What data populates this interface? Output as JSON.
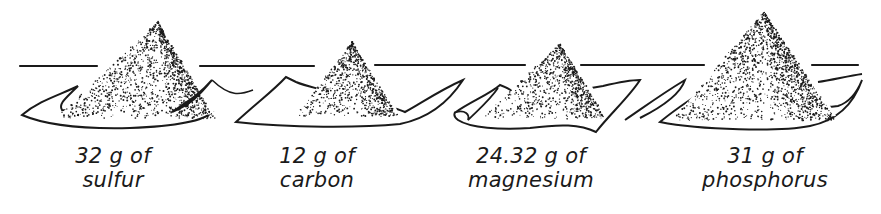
{
  "figure": {
    "ink_color": "#1a1a1a",
    "background_color": "#ffffff",
    "samples": [
      {
        "mass": "32 g of",
        "element": "sulfur",
        "mass_value_g": 32
      },
      {
        "mass": "12 g of",
        "element": "carbon",
        "mass_value_g": 12
      },
      {
        "mass": "24.32 g of",
        "element": "magnesium",
        "mass_value_g": 24.32
      },
      {
        "mass": "31 g of",
        "element": "phosphorus",
        "mass_value_g": 31
      }
    ]
  }
}
